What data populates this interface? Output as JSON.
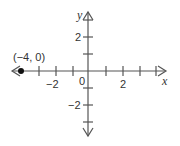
{
  "diagram": {
    "type": "coordinate-plane",
    "x_axis": {
      "label": "x",
      "min_visible": -4,
      "max_visible": 4,
      "ticks": [
        -4,
        -3,
        -2,
        -1,
        1,
        2,
        3,
        4
      ],
      "tick_labels": [
        {
          "value": -2,
          "text": "−2"
        },
        {
          "value": 2,
          "text": "2"
        }
      ]
    },
    "y_axis": {
      "label": "y",
      "ticks": [
        -3,
        -2,
        -1,
        1,
        2
      ],
      "tick_labels": [
        {
          "value": 2,
          "text": "2"
        },
        {
          "value": -2,
          "text": "−2"
        }
      ]
    },
    "origin_label": "0",
    "point": {
      "x": -4,
      "y": 0,
      "label": "(−4, 0)"
    },
    "colors": {
      "axis": "#555555",
      "point": "#111111",
      "text": "#333333"
    }
  }
}
